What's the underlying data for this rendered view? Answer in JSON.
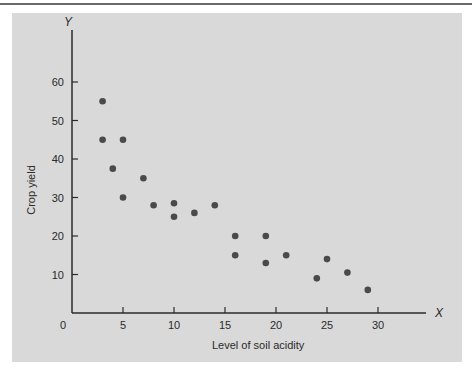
{
  "chart_data": {
    "type": "scatter",
    "title": "",
    "xlabel": "Level of soil acidity",
    "ylabel": "Crop yield",
    "x_axis_letter": "X",
    "y_axis_letter": "Y",
    "xlim": [
      0,
      35
    ],
    "ylim": [
      0,
      68
    ],
    "x_ticks": [
      5,
      10,
      15,
      20,
      25,
      30
    ],
    "y_ticks": [
      10,
      20,
      30,
      40,
      50,
      60
    ],
    "origin_label": "0",
    "grid": false,
    "legend": null,
    "points": [
      {
        "x": 3,
        "y": 55
      },
      {
        "x": 3,
        "y": 45
      },
      {
        "x": 5,
        "y": 45
      },
      {
        "x": 4,
        "y": 37.5
      },
      {
        "x": 7,
        "y": 35
      },
      {
        "x": 5,
        "y": 30
      },
      {
        "x": 8,
        "y": 28
      },
      {
        "x": 10,
        "y": 28.5
      },
      {
        "x": 10,
        "y": 25
      },
      {
        "x": 12,
        "y": 26
      },
      {
        "x": 14,
        "y": 28
      },
      {
        "x": 16,
        "y": 20
      },
      {
        "x": 16,
        "y": 15
      },
      {
        "x": 19,
        "y": 20
      },
      {
        "x": 19,
        "y": 13
      },
      {
        "x": 21,
        "y": 15
      },
      {
        "x": 24,
        "y": 9
      },
      {
        "x": 25,
        "y": 14
      },
      {
        "x": 27,
        "y": 10.5
      },
      {
        "x": 29,
        "y": 6
      }
    ],
    "colors": {
      "point": "#4a4a4a",
      "axis": "#2a2a2a",
      "panel": "#d9d9d9",
      "rule": "#6a6a6a"
    }
  }
}
